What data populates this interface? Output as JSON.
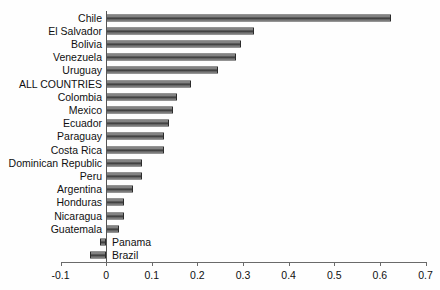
{
  "chart_data": {
    "type": "bar",
    "orientation": "horizontal",
    "title": "",
    "subtitle": "",
    "xlabel": "",
    "ylabel": "",
    "xlim": [
      -0.1,
      0.7
    ],
    "xticks": [
      "-0.1",
      "0",
      "0.1",
      "0.2",
      "0.3",
      "0.4",
      "0.5",
      "0.6",
      "0.7"
    ],
    "xtick_values": [
      -0.1,
      0,
      0.1,
      0.2,
      0.3,
      0.4,
      0.5,
      0.6,
      0.7
    ],
    "grid": false,
    "legend": null,
    "bar_color": "#4a4a4a",
    "bar_edge_color": "#2b2b2b",
    "axis_color": "#6a6a6a",
    "categories": [
      "Chile",
      "El Salvador",
      "Bolivia",
      "Venezuela",
      "Uruguay",
      "ALL COUNTRIES",
      "Colombia",
      "Mexico",
      "Ecuador",
      "Paraguay",
      "Costa Rica",
      "Dominican Republic",
      "Peru",
      "Argentina",
      "Honduras",
      "Nicaragua",
      "Guatemala",
      "Panama",
      "Brazil"
    ],
    "values": [
      0.625,
      0.325,
      0.295,
      0.285,
      0.245,
      0.187,
      0.155,
      0.147,
      0.137,
      0.126,
      0.126,
      0.079,
      0.078,
      0.059,
      0.039,
      0.039,
      0.029,
      -0.013,
      -0.036
    ],
    "series": [
      {
        "name": "value",
        "values": [
          0.625,
          0.325,
          0.295,
          0.285,
          0.245,
          0.187,
          0.155,
          0.147,
          0.137,
          0.126,
          0.126,
          0.079,
          0.078,
          0.059,
          0.039,
          0.039,
          0.029,
          -0.013,
          -0.036
        ]
      }
    ],
    "annotations": []
  }
}
